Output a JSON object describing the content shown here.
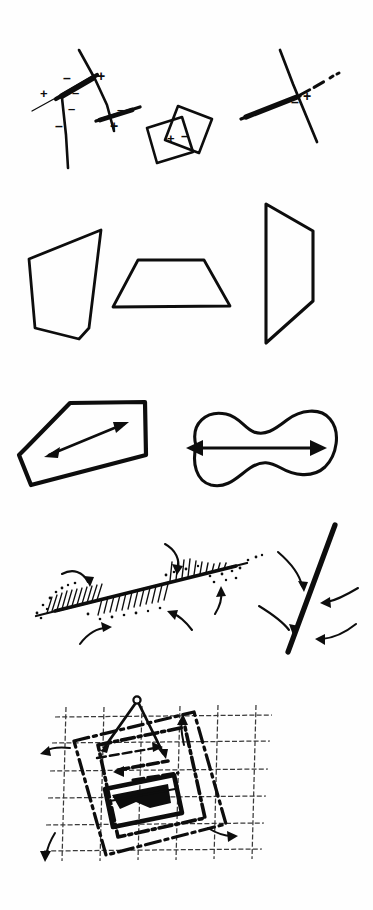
{
  "page": {
    "width": 373,
    "height": 910,
    "background_color": "#fefefe",
    "ink_color": "#0d0d0d",
    "text_content_present": false
  },
  "rows": [
    {
      "id": "row-1",
      "name": "crossing-lines-with-polarity-signs",
      "figures": [
        {
          "id": "fig-1a",
          "name": "branching-lines-cluster",
          "signs": [
            "+",
            "-",
            "-",
            "+",
            "-",
            "-",
            "-",
            "+"
          ]
        },
        {
          "id": "fig-1b",
          "name": "overlapping-squares",
          "signs": [
            "+",
            "-"
          ]
        },
        {
          "id": "fig-1c",
          "name": "thick-line-crossing-with-dashed-extension",
          "signs": [
            "-",
            "+"
          ]
        }
      ]
    },
    {
      "id": "row-2",
      "name": "quadrilateral-outlines",
      "figures": [
        {
          "id": "fig-2a",
          "name": "tilted-quadrilateral-left"
        },
        {
          "id": "fig-2b",
          "name": "trapezoid-center"
        },
        {
          "id": "fig-2c",
          "name": "tall-quadrilateral-right"
        }
      ]
    },
    {
      "id": "row-3",
      "name": "shapes-with-long-axis-arrows",
      "figures": [
        {
          "id": "fig-3a",
          "name": "hexagon-with-diagonal-double-arrow"
        },
        {
          "id": "fig-3b",
          "name": "peanut-blob-with-horizontal-double-arrow"
        }
      ]
    },
    {
      "id": "row-4",
      "name": "hachured-line-with-converging-arrows",
      "figures": [
        {
          "id": "fig-4a",
          "name": "hachured-stippled-line"
        },
        {
          "id": "fig-4b",
          "name": "thick-line-with-curved-arrows"
        }
      ]
    },
    {
      "id": "row-5",
      "name": "rotated-frames-over-grid",
      "figures": [
        {
          "id": "fig-5a",
          "name": "grid-with-rotated-dashed-rectangles-and-compass"
        }
      ]
    }
  ],
  "symbols": {
    "plus": "+",
    "minus": "–"
  },
  "signs_row1_fig1a": [
    {
      "label": "+",
      "x": 43,
      "y": 94
    },
    {
      "label": "–",
      "x": 67,
      "y": 80
    },
    {
      "label": "–",
      "x": 75,
      "y": 93
    },
    {
      "label": "+",
      "x": 91,
      "y": 77
    },
    {
      "label": "–",
      "x": 61,
      "y": 108
    },
    {
      "label": "–",
      "x": 50,
      "y": 124
    },
    {
      "label": "–",
      "x": 113,
      "y": 110
    },
    {
      "label": "+",
      "x": 108,
      "y": 127
    }
  ],
  "signs_row1_fig1b": [
    {
      "label": "+",
      "x": 171,
      "y": 139
    },
    {
      "label": "–",
      "x": 185,
      "y": 137
    }
  ],
  "signs_row1_fig1c": [
    {
      "label": "–",
      "x": 295,
      "y": 102
    },
    {
      "label": "+",
      "x": 307,
      "y": 96
    }
  ]
}
